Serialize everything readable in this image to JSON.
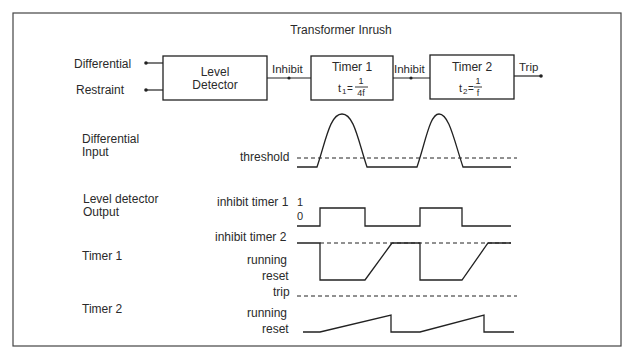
{
  "title": "Transformer Inrush",
  "block_diagram": {
    "inputs": [
      "Differential",
      "Restraint"
    ],
    "blocks": [
      {
        "label_line1": "Level",
        "label_line2": "Detector"
      },
      {
        "label_line1": "Timer 1",
        "formula_var": "t",
        "formula_sub": "1",
        "formula_num": "1",
        "formula_den": "4f"
      },
      {
        "label_line1": "Timer 2",
        "formula_var": "t",
        "formula_sub": "2",
        "formula_num": "1",
        "formula_den": "f"
      }
    ],
    "connections": [
      "Inhibit",
      "Inhibit",
      "Trip"
    ]
  },
  "signals": [
    {
      "name_line1": "Differential",
      "name_line2": "Input",
      "levels": [
        "threshold"
      ]
    },
    {
      "name_line1": "Level detector",
      "name_line2": "Output",
      "levels": [
        "inhibit timer 1",
        "1",
        "0"
      ]
    },
    {
      "name_line1": "Timer 1",
      "name_line2": "",
      "levels": [
        "inhibit timer 2",
        "running",
        "reset"
      ]
    },
    {
      "name_line1": "Timer 2",
      "name_line2": "",
      "levels": [
        "trip",
        "running",
        "reset"
      ]
    }
  ],
  "equals": "="
}
